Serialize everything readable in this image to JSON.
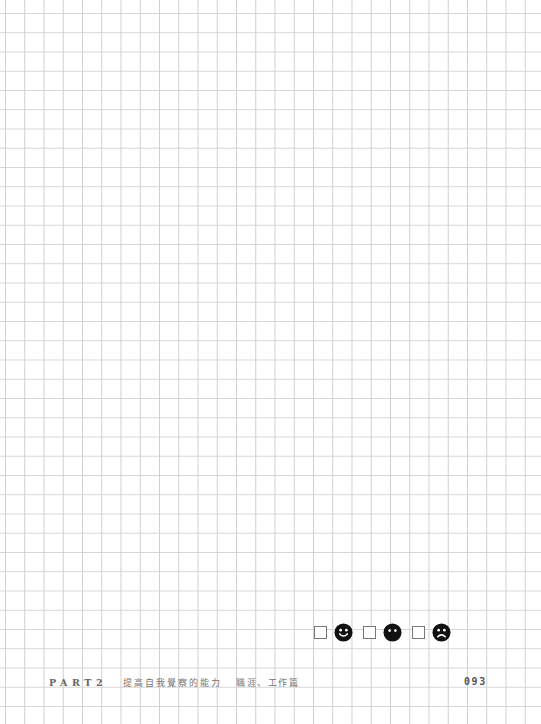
{
  "page": {
    "grid": {
      "spacing_px": 19.25,
      "line_color": "#d0d0d0",
      "background": "#ffffff"
    },
    "mood_check": [
      {
        "name": "happy",
        "icon": "smiley-happy-icon",
        "checked": false
      },
      {
        "name": "neutral",
        "icon": "smiley-neutral-icon",
        "checked": false
      },
      {
        "name": "sad",
        "icon": "smiley-sad-icon",
        "checked": false
      }
    ],
    "footer": {
      "part": "PART2",
      "chapter": "提高自我覺察的能力",
      "section": "職涯、工作篇",
      "page_number": "093"
    }
  }
}
